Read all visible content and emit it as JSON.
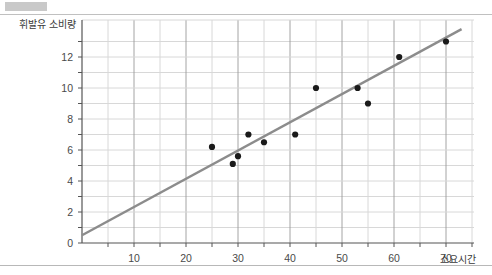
{
  "chart_data": {
    "type": "scatter",
    "title": "",
    "xlabel": "소요시간",
    "ylabel": "휘발유 소비량",
    "xlim": [
      0,
      76
    ],
    "ylim": [
      0,
      13.8
    ],
    "xticks": [
      10,
      20,
      30,
      40,
      50,
      60,
      70
    ],
    "yticks": [
      0,
      2,
      4,
      6,
      8,
      10,
      12
    ],
    "y_minor_ticks": [
      1,
      3,
      5,
      7,
      9,
      11,
      13
    ],
    "grid": true,
    "legend": "none",
    "points": [
      {
        "x": 25,
        "y": 6.2
      },
      {
        "x": 29,
        "y": 5.1
      },
      {
        "x": 30,
        "y": 5.6
      },
      {
        "x": 32,
        "y": 7.0
      },
      {
        "x": 35,
        "y": 6.5
      },
      {
        "x": 41,
        "y": 7.0
      },
      {
        "x": 45,
        "y": 10.0
      },
      {
        "x": 53,
        "y": 10.0
      },
      {
        "x": 55,
        "y": 9.0
      },
      {
        "x": 61,
        "y": 12.0
      },
      {
        "x": 70,
        "y": 13.0
      }
    ],
    "trendline": {
      "type": "linear",
      "x_start": 0,
      "y_start": 0.5,
      "x_end": 73,
      "y_end": 13.8,
      "color": "#8c8c8c"
    },
    "point_color": "#1a1a1a",
    "grid_color_major": "#9a9a9a",
    "grid_color_minor": "#d8d8d8",
    "axis_color": "#555555"
  },
  "page": {
    "corner_mark": "",
    "xtick_labels": [
      "10",
      "20",
      "30",
      "40",
      "50",
      "60",
      "70"
    ],
    "ytick_labels": [
      "0",
      "2",
      "4",
      "6",
      "8",
      "10",
      "12"
    ]
  }
}
